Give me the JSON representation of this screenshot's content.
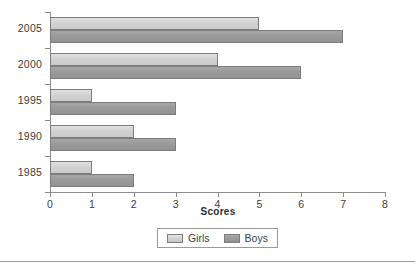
{
  "chart_data": {
    "type": "bar",
    "orientation": "horizontal",
    "title": "",
    "xlabel": "Scores",
    "ylabel": "",
    "categories": [
      "1985",
      "1990",
      "1995",
      "2000",
      "2005"
    ],
    "series": [
      {
        "name": "Girls",
        "color": "#d2d2d2",
        "values": [
          1,
          2,
          1,
          4,
          5
        ]
      },
      {
        "name": "Boys",
        "color": "#9a9a9a",
        "values": [
          2,
          3,
          3,
          6,
          7
        ]
      }
    ],
    "xlim": [
      0,
      8
    ],
    "xticks": [
      "0",
      "1",
      "2",
      "3",
      "4",
      "5",
      "6",
      "7",
      "8"
    ],
    "grid": false,
    "legend_position": "bottom"
  },
  "legend": {
    "entries": [
      {
        "label": "Girls"
      },
      {
        "label": "Boys"
      }
    ]
  },
  "axis": {
    "x_title": "Scores"
  }
}
